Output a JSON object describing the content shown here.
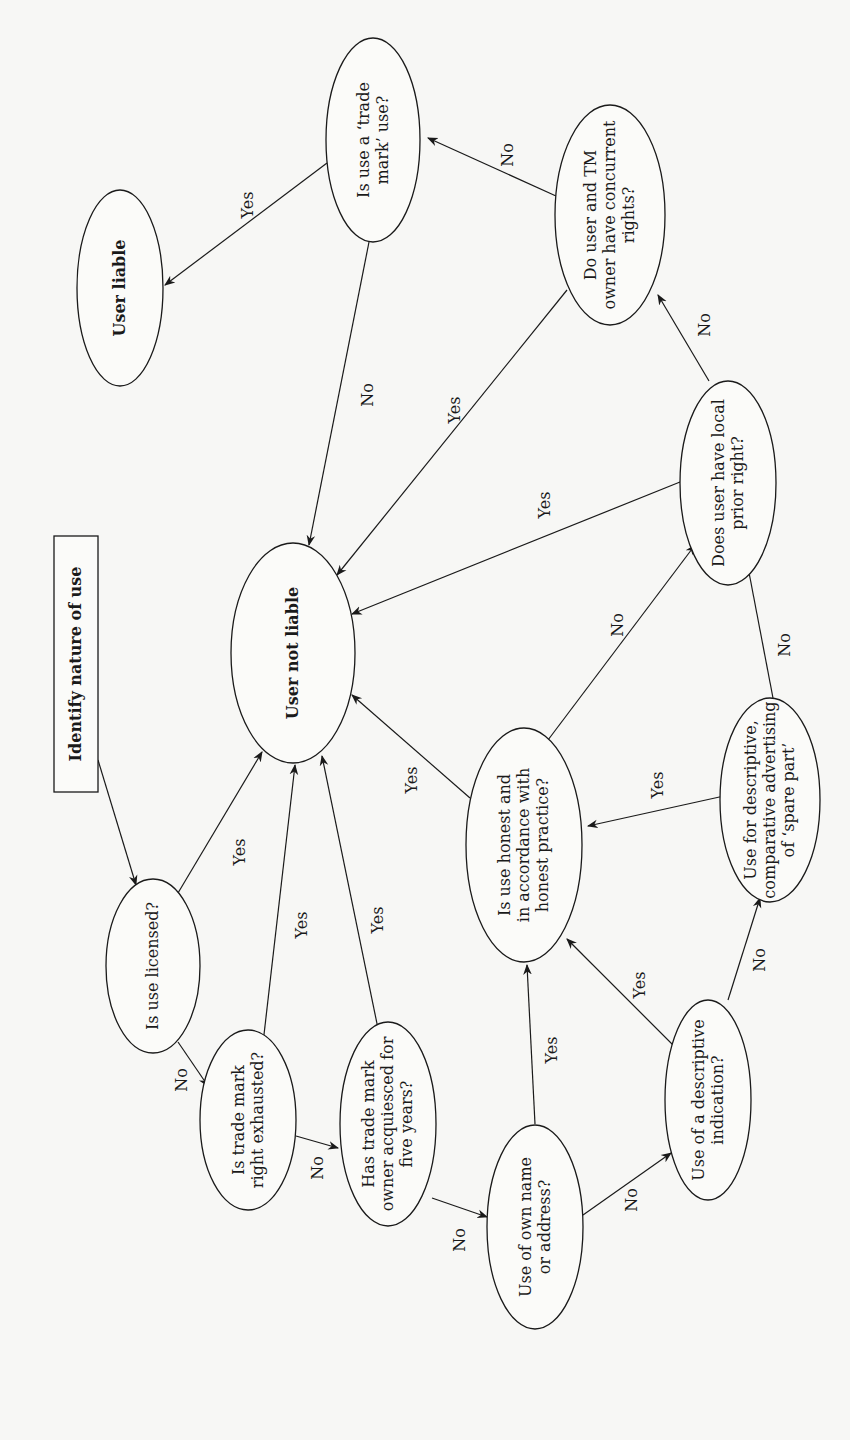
{
  "diagram": {
    "orientation": "rotated -90deg (text reads bottom-to-top)",
    "colors": {
      "background": "#f7f7f5",
      "stroke": "#1a1a1a",
      "text": "#1a1a1a"
    },
    "nodes": [
      {
        "id": "start",
        "shape": "rect",
        "bold": true,
        "x": 54,
        "y": 536,
        "w": 44,
        "h": 256,
        "lines": [
          "Identify nature of use"
        ]
      },
      {
        "id": "licensed",
        "shape": "ellipse",
        "cx": 153,
        "cy": 966,
        "rx": 47,
        "ry": 87,
        "lines": [
          "Is use licensed?"
        ]
      },
      {
        "id": "not_liable",
        "shape": "ellipse",
        "bold": true,
        "cx": 293,
        "cy": 653,
        "rx": 62,
        "ry": 110,
        "lines": [
          "User not liable"
        ]
      },
      {
        "id": "exhausted",
        "shape": "ellipse",
        "cx": 248,
        "cy": 1120,
        "rx": 48,
        "ry": 90,
        "lines": [
          "Is trade mark",
          "right exhausted?"
        ]
      },
      {
        "id": "acquiesced",
        "shape": "ellipse",
        "cx": 388,
        "cy": 1124,
        "rx": 48,
        "ry": 102,
        "lines": [
          "Has trade mark",
          "owner acquiesced for",
          "five years?"
        ]
      },
      {
        "id": "own_name",
        "shape": "ellipse",
        "cx": 535,
        "cy": 1227,
        "rx": 48,
        "ry": 102,
        "lines": [
          "Use of own name",
          "or address?"
        ]
      },
      {
        "id": "descriptive",
        "shape": "ellipse",
        "cx": 708,
        "cy": 1100,
        "rx": 43,
        "ry": 100,
        "lines": [
          "Use of a descriptive",
          "indication?"
        ]
      },
      {
        "id": "honest",
        "shape": "ellipse",
        "cx": 524,
        "cy": 845,
        "rx": 58,
        "ry": 117,
        "lines": [
          "Is use honest and",
          "in accordance with",
          "honest practice?"
        ]
      },
      {
        "id": "spare_part",
        "shape": "ellipse",
        "cx": 770,
        "cy": 800,
        "rx": 50,
        "ry": 102,
        "lines": [
          "Use for descriptive,",
          "comparative advertising",
          "of ‘spare part’"
        ]
      },
      {
        "id": "prior_right",
        "shape": "ellipse",
        "cx": 728,
        "cy": 483,
        "rx": 48,
        "ry": 102,
        "lines": [
          "Does user have local",
          "prior right?"
        ]
      },
      {
        "id": "concurrent",
        "shape": "ellipse",
        "cx": 610,
        "cy": 215,
        "rx": 55,
        "ry": 110,
        "lines": [
          "Do user and TM",
          "owner have concurrent",
          "rights?"
        ]
      },
      {
        "id": "tm_use",
        "shape": "ellipse",
        "cx": 373,
        "cy": 140,
        "rx": 47,
        "ry": 102,
        "lines": [
          "Is use a ‘trade",
          "mark’ use?"
        ]
      },
      {
        "id": "liable",
        "shape": "ellipse",
        "bold": true,
        "cx": 120,
        "cy": 288,
        "rx": 43,
        "ry": 98,
        "lines": [
          "User liable"
        ]
      }
    ],
    "edges": [
      {
        "from": "start",
        "to": "licensed",
        "label": "",
        "x1": 98,
        "y1": 760,
        "x2": 136,
        "y2": 885,
        "lx": 0,
        "ly": 0
      },
      {
        "from": "licensed",
        "to": "not_liable",
        "label": "Yes",
        "x1": 178,
        "y1": 893,
        "x2": 262,
        "y2": 752,
        "lx": 240,
        "ly": 852
      },
      {
        "from": "licensed",
        "to": "exhausted",
        "label": "No",
        "x1": 178,
        "y1": 1042,
        "x2": 208,
        "y2": 1086,
        "lx": 182,
        "ly": 1080
      },
      {
        "from": "exhausted",
        "to": "not_liable",
        "label": "Yes",
        "x1": 262,
        "y1": 1052,
        "x2": 295,
        "y2": 765,
        "lx": 302,
        "ly": 925
      },
      {
        "from": "exhausted",
        "to": "acquiesced",
        "label": "No",
        "x1": 296,
        "y1": 1136,
        "x2": 338,
        "y2": 1148,
        "lx": 318,
        "ly": 1168
      },
      {
        "from": "acquiesced",
        "to": "not_liable",
        "label": "Yes",
        "x1": 382,
        "y1": 1048,
        "x2": 322,
        "y2": 756,
        "lx": 378,
        "ly": 920
      },
      {
        "from": "acquiesced",
        "to": "own_name",
        "label": "No",
        "x1": 432,
        "y1": 1198,
        "x2": 487,
        "y2": 1217,
        "lx": 460,
        "ly": 1240
      },
      {
        "from": "own_name",
        "to": "honest",
        "label": "Yes",
        "x1": 535,
        "y1": 1124,
        "x2": 527,
        "y2": 965,
        "lx": 552,
        "ly": 1050
      },
      {
        "from": "own_name",
        "to": "descriptive",
        "label": "No",
        "x1": 583,
        "y1": 1215,
        "x2": 671,
        "y2": 1153,
        "lx": 632,
        "ly": 1200
      },
      {
        "from": "descriptive",
        "to": "honest",
        "label": "Yes",
        "x1": 685,
        "y1": 1057,
        "x2": 567,
        "y2": 939,
        "lx": 640,
        "ly": 985
      },
      {
        "from": "descriptive",
        "to": "spare_part",
        "label": "No",
        "x1": 728,
        "y1": 1000,
        "x2": 760,
        "y2": 898,
        "lx": 760,
        "ly": 960
      },
      {
        "from": "spare_part",
        "to": "honest",
        "label": "Yes",
        "x1": 724,
        "y1": 796,
        "x2": 588,
        "y2": 826,
        "lx": 658,
        "ly": 785
      },
      {
        "from": "honest",
        "to": "not_liable",
        "label": "Yes",
        "x1": 470,
        "y1": 798,
        "x2": 352,
        "y2": 695,
        "lx": 412,
        "ly": 780
      },
      {
        "from": "honest",
        "to": "prior_right",
        "label": "No",
        "x1": 548,
        "y1": 740,
        "x2": 695,
        "y2": 545,
        "lx": 618,
        "ly": 625
      },
      {
        "from": "spare_part",
        "to": "prior_right",
        "label": "No",
        "x1": 773,
        "y1": 698,
        "x2": 747,
        "y2": 562,
        "lx": 785,
        "ly": 645
      },
      {
        "from": "prior_right",
        "to": "not_liable",
        "label": "Yes",
        "x1": 680,
        "y1": 482,
        "x2": 352,
        "y2": 614,
        "lx": 545,
        "ly": 505
      },
      {
        "from": "prior_right",
        "to": "concurrent",
        "label": "No",
        "x1": 709,
        "y1": 381,
        "x2": 658,
        "y2": 295,
        "lx": 705,
        "ly": 325
      },
      {
        "from": "concurrent",
        "to": "not_liable",
        "label": "Yes",
        "x1": 567,
        "y1": 290,
        "x2": 337,
        "y2": 575,
        "lx": 455,
        "ly": 410
      },
      {
        "from": "concurrent",
        "to": "tm_use",
        "label": "No",
        "x1": 556,
        "y1": 196,
        "x2": 428,
        "y2": 138,
        "lx": 508,
        "ly": 155
      },
      {
        "from": "tm_use",
        "to": "not_liable",
        "label": "No",
        "x1": 369,
        "y1": 242,
        "x2": 309,
        "y2": 545,
        "lx": 368,
        "ly": 395
      },
      {
        "from": "tm_use",
        "to": "liable",
        "label": "Yes",
        "x1": 327,
        "y1": 163,
        "x2": 165,
        "y2": 285,
        "lx": 248,
        "ly": 205
      }
    ]
  }
}
